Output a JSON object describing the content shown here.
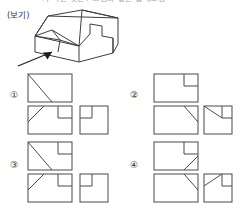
{
  "header": {
    "cutoff_text": "가 하는 것은? 그림과 같은 입체도형"
  },
  "prompt": {
    "bogi_label": "(보기)"
  },
  "figure": {
    "name": "3d-solid-with-arrow"
  },
  "options": [
    {
      "number": "①",
      "views": [
        {
          "name": "top-view",
          "notch": "none",
          "diagonal": "tl-to-center-down"
        },
        {
          "name": "front-view",
          "notch": "top-right",
          "diagonal": "bl-to-up-right"
        },
        {
          "name": "side-view",
          "notch": "top-left-inner",
          "diagonal": "none"
        }
      ]
    },
    {
      "number": "②",
      "views": [
        {
          "name": "top-view",
          "notch": "top-right",
          "diagonal": "none"
        },
        {
          "name": "front-view",
          "notch": "none",
          "diagonal": "top-right-down"
        },
        {
          "name": "side-view",
          "notch": "top-right",
          "diagonal": "tl-to-right"
        }
      ]
    },
    {
      "number": "③",
      "views": [
        {
          "name": "top-view",
          "notch": "top-right",
          "diagonal": "tl-to-center-down"
        },
        {
          "name": "front-view",
          "notch": "top-right",
          "diagonal": "bl-to-up-right"
        },
        {
          "name": "side-view",
          "notch": "top-left-inner",
          "diagonal": "none"
        }
      ]
    },
    {
      "number": "④",
      "views": [
        {
          "name": "top-view",
          "notch": "top-right",
          "diagonal": "br-short-up"
        },
        {
          "name": "front-view",
          "notch": "none",
          "diagonal": "top-right-down"
        },
        {
          "name": "side-view",
          "notch": "top-right",
          "diagonal": "tl-to-right"
        }
      ]
    }
  ],
  "colors": {
    "ink": "#3d3d3d",
    "paper": "#ffffff",
    "arrow": "#1d1d1d"
  }
}
